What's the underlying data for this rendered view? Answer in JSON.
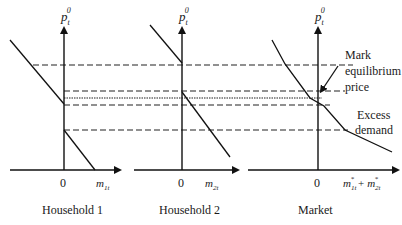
{
  "diagram": {
    "panels": [
      {
        "title": "Household 1",
        "y_axis_label": "p",
        "y_axis_sub": "t",
        "y_axis_sup": "0",
        "origin_label": "0",
        "x_axis_label": "m",
        "x_axis_sub": "1t"
      },
      {
        "title": "Household 2",
        "y_axis_label": "p",
        "y_axis_sub": "t",
        "y_axis_sup": "0",
        "origin_label": "0",
        "x_axis_label": "m",
        "x_axis_sub": "2t"
      },
      {
        "title": "Market",
        "y_axis_label": "p",
        "y_axis_sub": "t",
        "y_axis_sup": "0",
        "origin_label": "0",
        "x_axis_label_a": "m",
        "x_axis_sub_a": "1t",
        "x_axis_sup_a": "*",
        "plus": "+",
        "x_axis_label_b": "m",
        "x_axis_sub_b": "2t",
        "x_axis_sup_b": "*"
      }
    ],
    "annotations": {
      "equilibrium_line1": "Mark",
      "equilibrium_line2": "equilibrium",
      "equilibrium_line3": "price",
      "excess_line1": "Excess",
      "excess_line2": "demand"
    }
  }
}
